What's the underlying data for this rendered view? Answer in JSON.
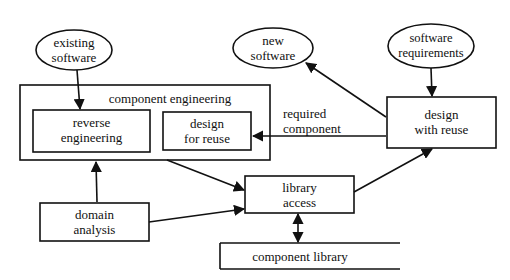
{
  "diagram": {
    "nodes": {
      "existing_software": {
        "line1": "existing",
        "line2": "software",
        "shape": "ellipse"
      },
      "new_software": {
        "line1": "new",
        "line2": "software",
        "shape": "ellipse"
      },
      "software_requirements": {
        "line1": "software",
        "line2": "requirements",
        "shape": "ellipse"
      },
      "component_engineering": {
        "label": "component engineering",
        "shape": "box-group"
      },
      "reverse_engineering": {
        "line1": "reverse",
        "line2": "engineering",
        "shape": "box"
      },
      "design_for_reuse": {
        "line1": "design",
        "line2": "for reuse",
        "shape": "box"
      },
      "design_with_reuse": {
        "line1": "design",
        "line2": "with reuse",
        "shape": "box"
      },
      "domain_analysis": {
        "line1": "domain",
        "line2": "analysis",
        "shape": "box"
      },
      "library_access": {
        "line1": "library",
        "line2": "access",
        "shape": "box"
      },
      "component_library": {
        "label": "component library",
        "shape": "datastore"
      }
    },
    "edge_labels": {
      "required_component": {
        "line1": "required",
        "line2": "component"
      }
    },
    "edges": [
      {
        "from": "existing_software",
        "to": "reverse_engineering"
      },
      {
        "from": "software_requirements",
        "to": "design_with_reuse"
      },
      {
        "from": "design_with_reuse",
        "to": "new_software"
      },
      {
        "from": "design_with_reuse",
        "to": "design_for_reuse",
        "label": "required component"
      },
      {
        "from": "domain_analysis",
        "to": "component_engineering"
      },
      {
        "from": "domain_analysis",
        "to": "library_access"
      },
      {
        "from": "component_engineering",
        "to": "library_access"
      },
      {
        "from": "library_access",
        "to": "design_with_reuse"
      },
      {
        "from": "library_access",
        "to": "component_library",
        "bidirectional": true
      }
    ]
  }
}
